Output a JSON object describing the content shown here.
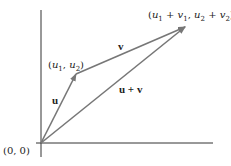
{
  "diagram": {
    "colors": {
      "axis": "#333333",
      "vector": "#777777",
      "text": "#222222"
    },
    "origin_label": "(0, 0)",
    "points": {
      "origin": {
        "x": 41,
        "y": 143
      },
      "u_tip": {
        "x": 76,
        "y": 74
      },
      "sum_tip": {
        "x": 185,
        "y": 27
      }
    },
    "labels": {
      "u_point": "(u1, u2)",
      "sum_point": "(u1 + v1, u2 + v2)",
      "u": "u",
      "v": "v",
      "u_plus_v": "u + v"
    }
  }
}
